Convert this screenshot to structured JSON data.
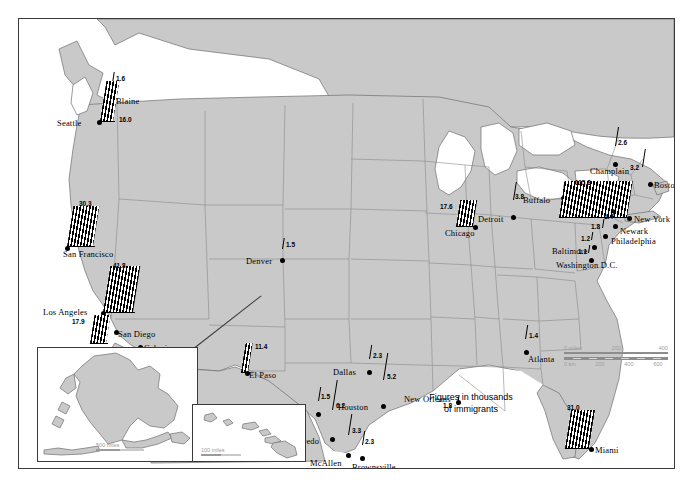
{
  "map": {
    "title": "Immigrant destinations in the United States",
    "caption": "Figures in thousands\nof immigrants",
    "colors": {
      "land": "#c9c9c9",
      "land_stroke": "#6e6e6e",
      "water": "#ffffff",
      "bar": "#000000",
      "frame": "#3a3a3a",
      "scale_text": "#a0a0a0"
    },
    "scale": {
      "miles_label": "0 miles",
      "miles_ticks": [
        "200",
        "400"
      ],
      "km_label": "0 km",
      "km_ticks": [
        "200",
        "400",
        "600"
      ]
    },
    "insets": [
      {
        "name": "alaska",
        "scale_label": "500 miles"
      },
      {
        "name": "hawaii",
        "scale_label": "100 miles"
      }
    ]
  },
  "chart_data": {
    "type": "bar",
    "units": "thousands of immigrants",
    "categories": [
      "Blaine",
      "Seattle",
      "San Francisco",
      "Los Angeles",
      "San Diego",
      "Calexico",
      "Denver",
      "El Paso",
      "Eagle Pass",
      "Laredo",
      "McAllen",
      "Brownsville",
      "Dallas",
      "Houston",
      "New Orleans",
      "Chicago",
      "Detroit",
      "Buffalo",
      "Champlain",
      "Boston",
      "New York",
      "Newark",
      "Philadelphia",
      "Baltimore",
      "Washington D.C.",
      "Atlanta",
      "Miami",
      "Honolulu"
    ],
    "values": [
      1.6,
      16.0,
      30.3,
      41.8,
      17.9,
      1.1,
      1.5,
      11.4,
      1.5,
      6.2,
      3.3,
      2.3,
      2.3,
      5.2,
      1.8,
      17.6,
      3.8,
      1.3,
      2.6,
      3.2,
      115.8,
      1.4,
      1.8,
      1.2,
      1.1,
      1.4,
      31.0,
      14.1
    ],
    "ylabel": "Immigrants (thousands)",
    "xlabel": "Destination city",
    "grid": false,
    "legend": false
  },
  "cities": [
    {
      "label": "Blaine",
      "value": "1.6",
      "dx": 91,
      "dy": 73,
      "nx": 6,
      "ny": 4,
      "vx": 6,
      "vy": -17,
      "bw": 0,
      "bh": 11,
      "bx": 2,
      "by": -12
    },
    {
      "label": "Seattle",
      "value": "16.0",
      "dx": 78,
      "dy": 101,
      "nx": -40,
      "ny": -2,
      "vx": 22,
      "vy": -4,
      "bw": 13,
      "bh": 40,
      "bx": 3,
      "by": -2
    },
    {
      "label": "San Francisco",
      "value": "30.3",
      "dx": 46,
      "dy": 227,
      "nx": -2,
      "ny": 4,
      "vx": 14,
      "vy": -46,
      "bw": 26,
      "bh": 40,
      "bx": 2,
      "by": -3
    },
    {
      "label": "Los Angeles",
      "value": "41.8",
      "dx": 82,
      "dy": 292,
      "nx": -58,
      "ny": -4,
      "vx": 12,
      "vy": -49,
      "bw": 30,
      "bh": 46,
      "bx": 2,
      "by": -2
    },
    {
      "label": "San Diego",
      "value": "17.9",
      "dx": 95,
      "dy": 311,
      "nx": 4,
      "ny": -1,
      "vx": -42,
      "vy": -12,
      "bw": 16,
      "bh": 28,
      "bx": -24,
      "by": 10
    },
    {
      "label": "Calexico",
      "value": "1.1",
      "dx": 119,
      "dy": 326,
      "nx": 6,
      "ny": -2,
      "vx": -12,
      "vy": 4,
      "bw": 0,
      "bh": 9,
      "bx": 2,
      "by": 8
    },
    {
      "label": "Denver",
      "value": "1.5",
      "dx": 261,
      "dy": 239,
      "nx": -34,
      "ny": -2,
      "vx": 6,
      "vy": -17,
      "bw": 0,
      "bh": 11,
      "bx": 2,
      "by": -12
    },
    {
      "label": "El Paso",
      "value": "11.4",
      "dx": 226,
      "dy": 352,
      "nx": 4,
      "ny": -1,
      "vx": 10,
      "vy": -28,
      "bw": 7,
      "bh": 29,
      "bx": -4,
      "by": -2
    },
    {
      "label": "Eagle Pass",
      "value": "1.5",
      "dx": 297,
      "dy": 393,
      "nx": -52,
      "ny": -1,
      "vx": 5,
      "vy": -19,
      "bw": 0,
      "bh": 14,
      "bx": 2,
      "by": -14
    },
    {
      "label": "Laredo",
      "value": "6.2",
      "dx": 311,
      "dy": 418,
      "nx": -36,
      "ny": -1,
      "vx": 6,
      "vy": -35,
      "bw": 0,
      "bh": 30,
      "bx": 2,
      "by": -30
    },
    {
      "label": "McAllen",
      "value": "3.3",
      "dx": 327,
      "dy": 434,
      "nx": -36,
      "ny": 5,
      "vx": 6,
      "vy": -26,
      "bw": 0,
      "bh": 21,
      "bx": 2,
      "by": -21
    },
    {
      "label": "Brownsville",
      "value": "2.3",
      "dx": 341,
      "dy": 437,
      "nx": -8,
      "ny": 6,
      "vx": 5,
      "vy": -18,
      "bw": 0,
      "bh": 14,
      "bx": 2,
      "by": -14
    },
    {
      "label": "Dallas",
      "value": "2.3",
      "dx": 348,
      "dy": 351,
      "nx": -34,
      "ny": -3,
      "vx": 6,
      "vy": -18,
      "bw": 0,
      "bh": 14,
      "bx": 2,
      "by": -14
    },
    {
      "label": "Houston",
      "value": "5.2",
      "dx": 362,
      "dy": 385,
      "nx": -43,
      "ny": -2,
      "vx": 6,
      "vy": -31,
      "bw": 0,
      "bh": 27,
      "bx": 2,
      "by": -27
    },
    {
      "label": "New Orleans",
      "value": "1.8",
      "dx": 437,
      "dy": 381,
      "nx": -52,
      "ny": -6,
      "vx": -13,
      "vy": 2,
      "bw": 0,
      "bh": 10,
      "bx": 1,
      "by": 2
    },
    {
      "label": "Chicago",
      "value": "17.6",
      "dx": 454,
      "dy": 206,
      "nx": -28,
      "ny": 3,
      "vx": -33,
      "vy": -22,
      "bw": 17,
      "bh": 26,
      "bx": -17,
      "by": -2
    },
    {
      "label": "Detroit",
      "value": "3.8",
      "dx": 492,
      "dy": 196,
      "nx": -33,
      "ny": -1,
      "vx": 4,
      "vy": -22,
      "bw": 0,
      "bh": 18,
      "bx": 2,
      "by": -18
    },
    {
      "label": "Buffalo",
      "value": "1.3",
      "dx": 542,
      "dy": 177,
      "nx": -38,
      "ny": -1,
      "vx": 6,
      "vy": -12,
      "bw": 0,
      "bh": 9,
      "bx": 2,
      "by": -9
    },
    {
      "label": "Champlain",
      "value": "2.6",
      "dx": 594,
      "dy": 143,
      "nx": -23,
      "ny": 4,
      "vx": 5,
      "vy": -23,
      "bw": 0,
      "bh": 19,
      "bx": 2,
      "by": -19
    },
    {
      "label": "Boston",
      "value": "3.2",
      "dx": 629,
      "dy": 163,
      "nx": 6,
      "ny": -2,
      "vx": -18,
      "vy": -18,
      "bw": 0,
      "bh": 18,
      "bx": -6,
      "by": -18
    },
    {
      "label": "New York",
      "value": "115.8",
      "dx": 608,
      "dy": 197,
      "nx": 7,
      "ny": -2,
      "vx": -52,
      "vy": -37,
      "bw": 68,
      "bh": 36,
      "bx": -68,
      "by": -2
    },
    {
      "label": "Newark",
      "value": "1.4",
      "dx": 594,
      "dy": 205,
      "nx": 7,
      "ny": 2,
      "vx": -9,
      "vy": -11,
      "bw": 0,
      "bh": 9,
      "bx": -1,
      "by": -9
    },
    {
      "label": "Philadelphia",
      "value": "1.8",
      "dx": 584,
      "dy": 215,
      "nx": 8,
      "ny": 2,
      "vx": -12,
      "vy": -11,
      "bw": 0,
      "bh": 9,
      "bx": -1,
      "by": -9
    },
    {
      "label": "Baltimore",
      "value": "1.2",
      "dx": 573,
      "dy": 226,
      "nx": -40,
      "ny": 1,
      "vx": -11,
      "vy": -10,
      "bw": 0,
      "bh": 8,
      "bx": -1,
      "by": -8
    },
    {
      "label": "Washington D.C.",
      "value": "1.1",
      "dx": 570,
      "dy": 239,
      "nx": -33,
      "ny": 3,
      "vx": -11,
      "vy": -10,
      "bw": 0,
      "bh": 8,
      "bx": -1,
      "by": -8
    },
    {
      "label": "Atlanta",
      "value": "1.4",
      "dx": 505,
      "dy": 331,
      "nx": 4,
      "ny": 4,
      "vx": 5,
      "vy": -18,
      "bw": 0,
      "bh": 14,
      "bx": 1,
      "by": -14
    },
    {
      "label": "Miami",
      "value": "31.0",
      "dx": 570,
      "dy": 428,
      "nx": 6,
      "ny": -2,
      "vx": -22,
      "vy": -43,
      "bw": 24,
      "bh": 38,
      "bx": -24,
      "by": -2
    },
    {
      "label": "Honolulu",
      "value": "14.1",
      "dx": 230,
      "dy": 411,
      "nx": 6,
      "ny": -4,
      "vx": -28,
      "vy": -3,
      "bw": 10,
      "bh": 28,
      "bx": -11,
      "by": 0
    }
  ]
}
